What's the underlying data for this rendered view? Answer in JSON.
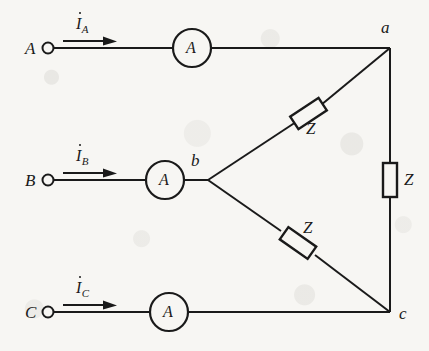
{
  "diagram": {
    "stroke_color": "#1a1a1a",
    "background_color": "#f7f6f3",
    "lines": [
      {
        "name": "phase-a",
        "terminal_label": "A",
        "current_label": "I",
        "current_subscript": "A",
        "meter_label": "A"
      },
      {
        "name": "phase-b",
        "terminal_label": "B",
        "current_label": "I",
        "current_subscript": "B",
        "meter_label": "A"
      },
      {
        "name": "phase-c",
        "terminal_label": "C",
        "current_label": "I",
        "current_subscript": "C",
        "meter_label": "A"
      }
    ],
    "nodes": [
      {
        "name": "node-a",
        "label": "a"
      },
      {
        "name": "node-b",
        "label": "b"
      },
      {
        "name": "node-c",
        "label": "c"
      }
    ],
    "impedances": [
      {
        "name": "impedance-ab",
        "label": "Z"
      },
      {
        "name": "impedance-ac",
        "label": "Z"
      },
      {
        "name": "impedance-bc",
        "label": "Z"
      }
    ]
  }
}
